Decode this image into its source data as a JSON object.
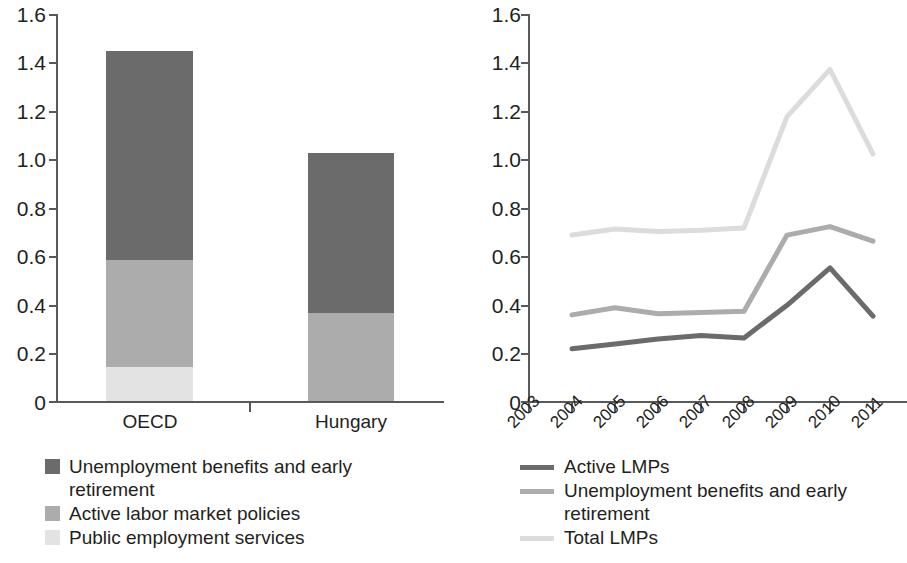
{
  "chart_data": [
    {
      "type": "bar",
      "subtype": "stacked-vertical",
      "title": "",
      "xlabel": "",
      "ylabel": "",
      "categories": [
        "OECD",
        "Hungary"
      ],
      "ylim": [
        0,
        1.6
      ],
      "yticks": [
        "0",
        "0.2",
        "0.4",
        "0.6",
        "0.8",
        "1.0",
        "1.2",
        "1.4",
        "1.6"
      ],
      "ytick_values": [
        0,
        0.2,
        0.4,
        0.6,
        0.8,
        1.0,
        1.2,
        1.4,
        1.6
      ],
      "grid": false,
      "legend_position": "bottom-left",
      "stack_order_bottom_to_top": [
        "Public employment services",
        "Active labor market policies",
        "Unemployment benefits and early retirement"
      ],
      "series": [
        {
          "name": "Public employment services",
          "color": "#e3e3e3",
          "values": [
            0.14,
            0.0
          ]
        },
        {
          "name": "Active labor market policies",
          "color": "#acacac",
          "values": [
            0.44,
            0.36
          ]
        },
        {
          "name": "Unemployment benefits and early retirement",
          "color": "#6b6b6b",
          "values": [
            0.86,
            0.66
          ]
        }
      ],
      "totals": [
        1.44,
        1.02
      ]
    },
    {
      "type": "line",
      "title": "",
      "xlabel": "",
      "ylabel": "",
      "x": [
        "2003",
        "2004",
        "2005",
        "2006",
        "2007",
        "2008",
        "2009",
        "2010",
        "2011"
      ],
      "ylim": [
        0,
        1.6
      ],
      "yticks": [
        "0",
        "0.2",
        "0.4",
        "0.6",
        "0.8",
        "1.0",
        "1.2",
        "1.4",
        "1.6"
      ],
      "ytick_values": [
        0,
        0.2,
        0.4,
        0.6,
        0.8,
        1.0,
        1.2,
        1.4,
        1.6
      ],
      "grid": false,
      "legend_position": "bottom-left",
      "series": [
        {
          "name": "Active LMPs",
          "color": "#6b6b6b",
          "x": [
            "2004",
            "2005",
            "2006",
            "2007",
            "2008",
            "2009",
            "2010",
            "2011"
          ],
          "values": [
            0.22,
            0.24,
            0.26,
            0.275,
            0.265,
            0.4,
            0.555,
            0.355
          ]
        },
        {
          "name": "Unemployment benefits and early retirement",
          "color": "#acacac",
          "x": [
            "2004",
            "2005",
            "2006",
            "2007",
            "2008",
            "2009",
            "2010",
            "2011"
          ],
          "values": [
            0.36,
            0.39,
            0.365,
            0.37,
            0.375,
            0.69,
            0.725,
            0.665
          ]
        },
        {
          "name": "Total LMPs",
          "color": "#dcdcdc",
          "x": [
            "2004",
            "2005",
            "2006",
            "2007",
            "2008",
            "2009",
            "2010",
            "2011"
          ],
          "values": [
            0.69,
            0.715,
            0.705,
            0.71,
            0.72,
            1.18,
            1.375,
            1.025
          ]
        }
      ]
    }
  ],
  "bar_chart": {
    "yticks": [
      {
        "label": "1.6"
      },
      {
        "label": "1.4"
      },
      {
        "label": "1.2"
      },
      {
        "label": "1.0"
      },
      {
        "label": "0.8"
      },
      {
        "label": "0.6"
      },
      {
        "label": "0.4"
      },
      {
        "label": "0.2"
      },
      {
        "label": "0"
      }
    ],
    "categories": [
      {
        "label": "OECD"
      },
      {
        "label": "Hungary"
      }
    ],
    "legend": [
      {
        "label": "Unemployment benefits and early retirement",
        "color": "#6b6b6b"
      },
      {
        "label": "Active labor market policies",
        "color": "#acacac"
      },
      {
        "label": "Public employment services",
        "color": "#e3e3e3"
      }
    ]
  },
  "line_chart": {
    "yticks": [
      {
        "label": "1.6"
      },
      {
        "label": "1.4"
      },
      {
        "label": "1.2"
      },
      {
        "label": "1.0"
      },
      {
        "label": "0.8"
      },
      {
        "label": "0.6"
      },
      {
        "label": "0.4"
      },
      {
        "label": "0.2"
      },
      {
        "label": "0"
      }
    ],
    "xticks": [
      {
        "label": "2003"
      },
      {
        "label": "2004"
      },
      {
        "label": "2005"
      },
      {
        "label": "2006"
      },
      {
        "label": "2007"
      },
      {
        "label": "2008"
      },
      {
        "label": "2009"
      },
      {
        "label": "2010"
      },
      {
        "label": "2011"
      }
    ],
    "legend": [
      {
        "label": "Active LMPs",
        "color": "#6b6b6b"
      },
      {
        "label": "Unemployment benefits and early retirement",
        "color": "#acacac"
      },
      {
        "label": "Total LMPs",
        "color": "#dcdcdc"
      }
    ]
  }
}
